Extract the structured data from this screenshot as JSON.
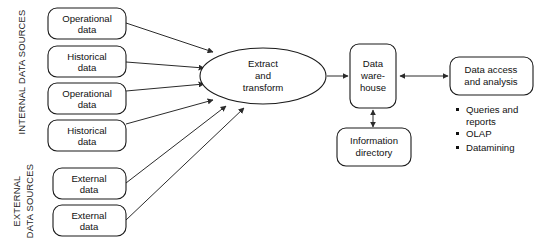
{
  "diagram": {
    "stroke_color": "#1a1a1a",
    "text_color": "#111111",
    "background": "#ffffff"
  },
  "side_labels": {
    "internal": "INTERNAL DATA SOURCES",
    "external_line1": "EXTERNAL",
    "external_line2": "DATA SOURCES"
  },
  "sources": {
    "internal": [
      {
        "line1": "Operational",
        "line2": "data"
      },
      {
        "line1": "Historical",
        "line2": "data"
      },
      {
        "line1": "Operational",
        "line2": "data"
      },
      {
        "line1": "Historical",
        "line2": "data"
      }
    ],
    "external": [
      {
        "line1": "External",
        "line2": "data"
      },
      {
        "line1": "External",
        "line2": "data"
      }
    ]
  },
  "process": {
    "line1": "Extract",
    "line2": "and",
    "line3": "transform"
  },
  "warehouse": {
    "line1": "Data",
    "line2": "ware-",
    "line3": "house"
  },
  "information_directory": {
    "line1": "Information",
    "line2": "directory"
  },
  "access": {
    "line1": "Data access",
    "line2": "and analysis"
  },
  "access_bullets": [
    {
      "line1": "Queries and",
      "line2": "reports"
    },
    {
      "line1": "OLAP",
      "line2": ""
    },
    {
      "line1": "Datamining",
      "line2": ""
    }
  ]
}
